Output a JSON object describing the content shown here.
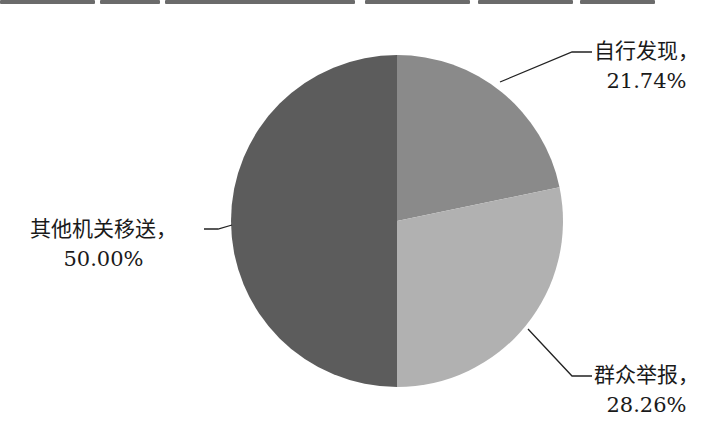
{
  "chart_data": {
    "type": "pie",
    "title": "",
    "categories": [
      "自行发现",
      "群众举报",
      "其他机关移送"
    ],
    "values": [
      21.74,
      28.26,
      50.0
    ],
    "unit": "%",
    "labels": [
      {
        "name": "自行发现，",
        "value": "21.74%"
      },
      {
        "name": "群众举报，",
        "value": "28.26%"
      },
      {
        "name": "其他机关移送，",
        "value": "50.00%"
      }
    ],
    "colors": [
      "#8a8a8a",
      "#b1b1b1",
      "#5c5c5c"
    ],
    "start_angle_deg": 0,
    "direction": "clockwise",
    "legend": "none",
    "data_labels": "outside with leader lines"
  }
}
